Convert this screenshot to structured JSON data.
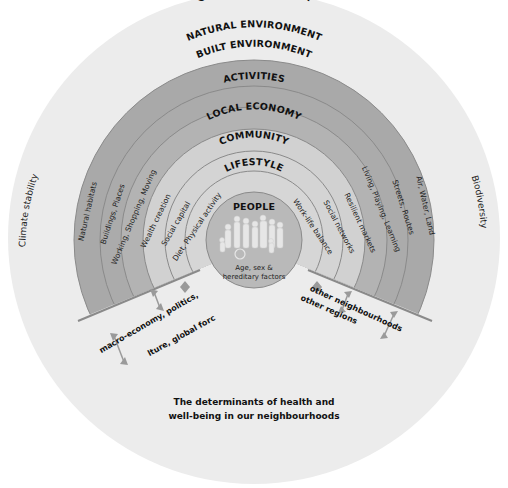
{
  "diagram": {
    "global_label": "GLOBAL ECOSYSTEM",
    "left_side_label": "Climate stability",
    "right_side_label": "Biodiversity",
    "rings": [
      {
        "label": "NATURAL ENVIRONMENT",
        "left": "Natural habitats",
        "right": "Air, Water, Land"
      },
      {
        "label": "BUILT ENVIRONMENT",
        "left": "Buildings, Places",
        "right": "Streets, Routes"
      },
      {
        "label": "ACTIVITIES",
        "left": "Working, Shopping, Moving",
        "right": "Living, Playing, Learning"
      },
      {
        "label": "LOCAL ECONOMY",
        "left": "Wealth creation",
        "right": "Resilient markets"
      },
      {
        "label": "COMMUNITY",
        "left": "Social capital",
        "right": "Social networks"
      },
      {
        "label": "LIFESTYLE",
        "left": "Diet, Physical activity",
        "right": "Work-life balance"
      }
    ],
    "center": {
      "label": "PEOPLE",
      "sublabel_line1": "Age, sex &",
      "sublabel_line2": "hereditary factors"
    },
    "left_note": {
      "line1": "macro-economy, politics,",
      "line2": "culture, global forces"
    },
    "right_note": {
      "line1": "other neighbourhoods",
      "line2": "other regions"
    },
    "caption": {
      "line1": "The determinants of health and",
      "line2": "well-being in our neighbourhoods"
    },
    "colors": {
      "global": "#ececec",
      "outer_bands": "#a9a9a9",
      "inner_bands": "#cfcfcf",
      "people": "#b8b8b8",
      "ring_line": "#808080",
      "arrow": "#9a9a9a"
    }
  }
}
